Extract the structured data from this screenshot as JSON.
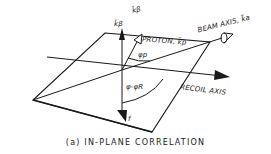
{
  "diagram": {
    "labels": {
      "k_beta_upper": "k̄β",
      "k_beta": "k̄β",
      "proton": "PROTON, k̄p",
      "phi_p": "φp",
      "beam_axis": "BEAM AXIS, k̄a",
      "phi_minus_phi_r": "φ-φR",
      "recoil_axis": "RECOIL AXIS",
      "f": "f"
    },
    "caption": "(a) IN-PLANE CORRELATION",
    "colors": {
      "ink": "#1a1a1a",
      "background": "#ffffff"
    }
  }
}
